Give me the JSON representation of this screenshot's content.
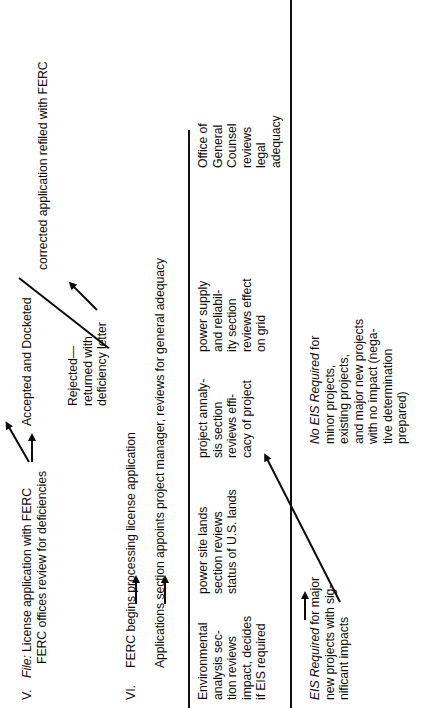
{
  "document": {
    "orientation": "rotated-90-ccw",
    "ink_color": "#0b0b0b",
    "background_color": "#ffffff"
  },
  "sections": [
    {
      "number": "V.",
      "id": "section-v"
    },
    {
      "number": "VI.",
      "id": "section-vi"
    }
  ],
  "steps": {
    "file_step_line1_lead": "File:",
    "file_step_line1_rest": " License application with FERC",
    "file_step_line2": "FERC offices review for deficiencies",
    "accepted": "Accepted and Docketed",
    "rejected_line1": "Rejected—",
    "rejected_line2": "returned with",
    "rejected_line3": "deficiency letter",
    "refiled": "corrected application refiled with FERC",
    "ferc_begins": "FERC begins processing license application",
    "applications_section": "Applications section appoints project manager, reviews for general adequacy"
  },
  "review_columns": [
    {
      "id": "environmental-analysis",
      "lines": [
        "Environmental",
        "analysis sec-",
        "tion reviews",
        "impact, decides",
        "if EIS required"
      ]
    },
    {
      "id": "power-site-lands",
      "lines": [
        "power site lands",
        "section reviews",
        "status of U.S. lands"
      ]
    },
    {
      "id": "project-analysis",
      "lines": [
        "project annaly-",
        "sis section",
        "reviews effi-",
        "cacy of project"
      ]
    },
    {
      "id": "power-supply-reliability",
      "lines": [
        "power supply",
        "and reliabil-",
        "ity section",
        "reviews effect",
        "on grid"
      ]
    },
    {
      "id": "office-general-counsel",
      "lines": [
        "Office of",
        "General",
        "Counsel",
        "reviews",
        "legal",
        "adequacy"
      ]
    }
  ],
  "outcomes": {
    "eis_required": {
      "lead": "EIS Required",
      "line1_rest": " for major",
      "line2": "new projects with sig-",
      "line3": "nificant impacts"
    },
    "no_eis_required": {
      "lead": "No EIS Required",
      "line1_rest": " for",
      "line2": "minor projects,",
      "line3": "existing projects,",
      "line4": "and major new projects",
      "line5": "with no impact (nega-",
      "line6": "tive determination",
      "line7": "prepared)"
    }
  }
}
